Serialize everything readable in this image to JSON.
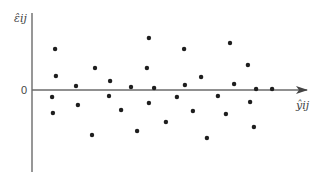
{
  "chart_data": {
    "type": "scatter",
    "title": "",
    "xlabel": "ŷij",
    "ylabel": "ε̂ij",
    "y_tick_labels": [
      "0"
    ],
    "xlim": [
      0,
      10
    ],
    "ylim": [
      -8.2,
      7.7
    ],
    "grid": false,
    "legend": "none",
    "axis_style": "origin-axes with arrow on horizontal axis at residual = 0",
    "points": [
      {
        "x": 0.84,
        "y": 4.1
      },
      {
        "x": 0.87,
        "y": 1.4
      },
      {
        "x": 0.73,
        "y": -0.7
      },
      {
        "x": 0.76,
        "y": -2.3
      },
      {
        "x": 1.6,
        "y": 0.4
      },
      {
        "x": 1.67,
        "y": -1.5
      },
      {
        "x": 2.29,
        "y": 2.2
      },
      {
        "x": 2.18,
        "y": -4.5
      },
      {
        "x": 2.84,
        "y": 0.9
      },
      {
        "x": 2.8,
        "y": -0.6
      },
      {
        "x": 3.24,
        "y": -2.0
      },
      {
        "x": 3.6,
        "y": 0.3
      },
      {
        "x": 3.82,
        "y": -4.1
      },
      {
        "x": 4.18,
        "y": 2.2
      },
      {
        "x": 4.25,
        "y": 5.2
      },
      {
        "x": 4.25,
        "y": -1.3
      },
      {
        "x": 4.44,
        "y": 0.2
      },
      {
        "x": 4.87,
        "y": -3.2
      },
      {
        "x": 5.27,
        "y": -0.7
      },
      {
        "x": 5.53,
        "y": 4.1
      },
      {
        "x": 5.56,
        "y": 0.5
      },
      {
        "x": 5.85,
        "y": -2.1
      },
      {
        "x": 6.15,
        "y": 1.3
      },
      {
        "x": 6.36,
        "y": -4.8
      },
      {
        "x": 6.76,
        "y": -0.6
      },
      {
        "x": 7.05,
        "y": -2.4
      },
      {
        "x": 7.2,
        "y": 4.7
      },
      {
        "x": 7.35,
        "y": 0.6
      },
      {
        "x": 7.85,
        "y": 2.5
      },
      {
        "x": 7.93,
        "y": -1.2
      },
      {
        "x": 8.07,
        "y": -3.7
      },
      {
        "x": 8.15,
        "y": 0.1
      },
      {
        "x": 8.73,
        "y": 0.1
      }
    ],
    "colors": {
      "points": "#1e1e1e",
      "axes": "#6b6b6b"
    }
  }
}
